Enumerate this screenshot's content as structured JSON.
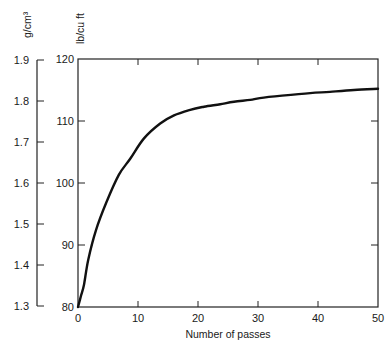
{
  "chart_data": {
    "type": "line",
    "title": "",
    "xlabel": "Number of passes",
    "ylabel": "lb/cu ft",
    "ylabel_secondary": "g/cm³",
    "xlim": [
      0,
      50
    ],
    "ylim": [
      80,
      120
    ],
    "ylim_secondary": [
      1.3,
      1.9
    ],
    "grid": false,
    "legend": null,
    "x_ticks": [
      0,
      10,
      20,
      30,
      40,
      50
    ],
    "y_ticks": [
      80,
      90,
      100,
      110,
      120
    ],
    "y_ticks_secondary": [
      "1.3",
      "1.4",
      "1.5",
      "1.6",
      "1.7",
      "1.8",
      "1.9"
    ],
    "series": [
      {
        "name": "Density vs. passes",
        "x": [
          0,
          0.5,
          1,
          1.7,
          3,
          4.7,
          6.8,
          8.7,
          11,
          13.7,
          16,
          18.7,
          21,
          23.7,
          26,
          28.7,
          30.3,
          34,
          38.7,
          42,
          46,
          50
        ],
        "y": [
          80,
          81.8,
          83.6,
          87.6,
          92.4,
          96.8,
          101.3,
          103.9,
          107.2,
          109.6,
          110.9,
          111.8,
          112.3,
          112.7,
          113.1,
          113.4,
          113.7,
          114.1,
          114.5,
          114.7,
          115.0,
          115.2
        ]
      }
    ]
  }
}
